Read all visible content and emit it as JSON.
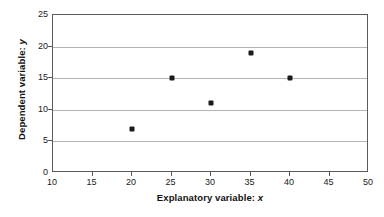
{
  "chart_data": {
    "type": "scatter",
    "title": "",
    "xlabel_parts": {
      "text": "Explanatory variable:",
      "italic": "x"
    },
    "ylabel_parts": {
      "text": "Dependent  variable:",
      "italic": "y"
    },
    "xlabel": "Explanatory variable: x",
    "ylabel": "Dependent variable: y",
    "xlim": [
      10,
      50
    ],
    "ylim": [
      0,
      25
    ],
    "xticks": [
      10,
      15,
      20,
      25,
      30,
      35,
      40,
      45,
      50
    ],
    "yticks": [
      0,
      5,
      10,
      15,
      20,
      25
    ],
    "xtick_labels": [
      "10",
      "15",
      "20",
      "25",
      "30",
      "35",
      "40",
      "45",
      "50"
    ],
    "ytick_labels": [
      "0",
      "5",
      "10",
      "15",
      "20",
      "25"
    ],
    "gridlines": {
      "horizontal": [
        5,
        10,
        15,
        20
      ],
      "vertical": []
    },
    "grid": true,
    "legend": null,
    "series": [
      {
        "name": "data",
        "marker": "filled-square",
        "color": "#1a1a1a",
        "x": [
          20,
          25,
          30,
          35,
          40
        ],
        "y": [
          7,
          15,
          11,
          19,
          15
        ],
        "points": [
          {
            "x": 20,
            "y": 7
          },
          {
            "x": 25,
            "y": 15
          },
          {
            "x": 30,
            "y": 11
          },
          {
            "x": 35,
            "y": 19
          },
          {
            "x": 40,
            "y": 15
          }
        ]
      }
    ],
    "colors": {
      "marker": "#1a1a1a",
      "gridline": "#b4b4b4",
      "frame": "#5a5a5a",
      "background": "#ffffff",
      "text": "#111111"
    }
  }
}
